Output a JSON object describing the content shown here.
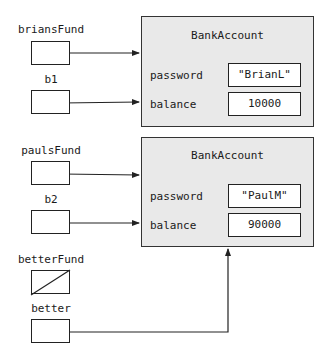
{
  "variables": [
    {
      "name": "briansFund",
      "points_to": "account1",
      "null": false
    },
    {
      "name": "b1",
      "points_to": "account1",
      "null": false
    },
    {
      "name": "paulsFund",
      "points_to": "account2",
      "null": false
    },
    {
      "name": "b2",
      "points_to": "account2",
      "null": false
    },
    {
      "name": "betterFund",
      "points_to": null,
      "null": true
    },
    {
      "name": "better",
      "points_to": "account2",
      "null": false
    }
  ],
  "objects": {
    "account1": {
      "class_name": "BankAccount",
      "fields": [
        {
          "name": "password",
          "value": "\"BrianL\""
        },
        {
          "name": "balance",
          "value": "10000"
        }
      ]
    },
    "account2": {
      "class_name": "BankAccount",
      "fields": [
        {
          "name": "password",
          "value": "\"PaulM\""
        },
        {
          "name": "balance",
          "value": "90000"
        }
      ]
    }
  },
  "colors": {
    "object_fill": "#e9e9e9",
    "stroke": "#222222",
    "background": "#ffffff"
  }
}
